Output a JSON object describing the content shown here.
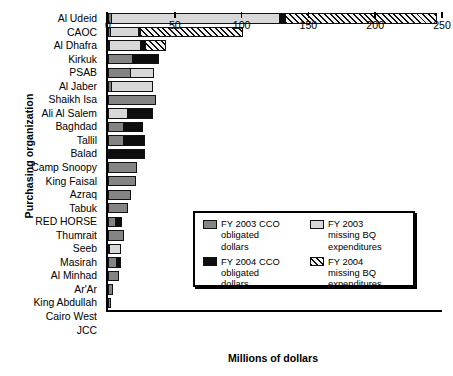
{
  "chart_data": {
    "type": "bar",
    "orientation": "horizontal",
    "stacked": true,
    "title": "",
    "xlabel": "Millions of dollars",
    "ylabel": "Purchasing organization",
    "xlim": [
      0,
      250
    ],
    "xticks": [
      0,
      50,
      100,
      150,
      200,
      250
    ],
    "grid": false,
    "legend_position": "inside-right-lower",
    "categories": [
      "Al Udeid",
      "CAOC",
      "Al Dhafra",
      "Kirkuk",
      "PSAB",
      "Al Jaber",
      "Shaikh Isa",
      "Ali Al Salem",
      "Baghdad",
      "Tallil",
      "Balad",
      "Camp Snoopy",
      "King Faisal",
      "Azraq",
      "Tabuk",
      "RED HORSE",
      "Thumrait",
      "Seeb",
      "Masirah",
      "Al Minhad",
      "Ar'Ar",
      "King Abdullah",
      "Cairo West",
      "JCC"
    ],
    "series": [
      {
        "name": "FY 2003 CCO obligated dollars",
        "key": "cco03",
        "color": "#848484",
        "values": [
          3,
          2,
          1,
          19,
          17,
          3,
          36,
          0,
          12,
          12,
          0,
          22,
          21,
          17,
          15,
          6,
          12,
          1,
          7,
          8,
          4,
          2,
          0,
          0
        ]
      },
      {
        "name": "FY 2003 missing BQ expenditures",
        "key": "bq03",
        "color": "#d8d8d8",
        "values": [
          126,
          22,
          24,
          0,
          18,
          31,
          0,
          15,
          0,
          0,
          0,
          0,
          0,
          0,
          0,
          0,
          0,
          9,
          0,
          0,
          0,
          0,
          0,
          0
        ]
      },
      {
        "name": "FY 2004 CCO obligated dollars",
        "key": "cco04",
        "color": "#0d0d0d",
        "values": [
          5,
          2,
          4,
          20,
          0,
          0,
          0,
          19,
          15,
          16,
          28,
          0,
          0,
          0,
          0,
          5,
          0,
          0,
          3,
          0,
          0,
          0,
          0,
          0
        ]
      },
      {
        "name": "FY 2004 missing BQ expenditures",
        "key": "bq04",
        "color": "hatched",
        "values": [
          114,
          77,
          16,
          0,
          0,
          0,
          0,
          0,
          0,
          0,
          0,
          0,
          0,
          0,
          0,
          0,
          0,
          0,
          0,
          0,
          0,
          0,
          0,
          0
        ]
      }
    ]
  },
  "legend": {
    "items": [
      {
        "swatch": "cco03",
        "line1": "FY 2003 CCO",
        "line2": "obligated",
        "line3": "dollars"
      },
      {
        "swatch": "bq03",
        "line1": "FY 2003",
        "line2": "missing BQ",
        "line3": "expenditures"
      },
      {
        "swatch": "cco04",
        "line1": "FY 2004 CCO",
        "line2": "obligated",
        "line3": "dollars"
      },
      {
        "swatch": "bq04",
        "line1": "FY 2004",
        "line2": "missing BQ",
        "line3": "expenditures"
      }
    ]
  }
}
